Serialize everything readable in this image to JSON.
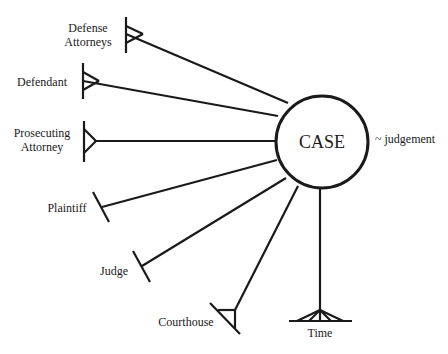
{
  "diagram": {
    "type": "entity-relationship",
    "center": {
      "label": "CASE",
      "annotation": "~ judgement"
    },
    "entities": [
      {
        "label_lines": [
          "Defense",
          "Attorneys"
        ],
        "connector": "crows-foot-many"
      },
      {
        "label_lines": [
          "Defendant"
        ],
        "connector": "crows-foot-many"
      },
      {
        "label_lines": [
          "Prosecuting",
          "Attorney"
        ],
        "connector": "crows-foot"
      },
      {
        "label_lines": [
          "Plaintiff"
        ],
        "connector": "one"
      },
      {
        "label_lines": [
          "Judge"
        ],
        "connector": "one"
      },
      {
        "label_lines": [
          "Courthouse"
        ],
        "connector": "crows-foot"
      },
      {
        "label_lines": [
          "Time"
        ],
        "connector": "crows-foot-many"
      }
    ],
    "colors": {
      "line": "#1a1a1a",
      "background": "#ffffff"
    }
  }
}
